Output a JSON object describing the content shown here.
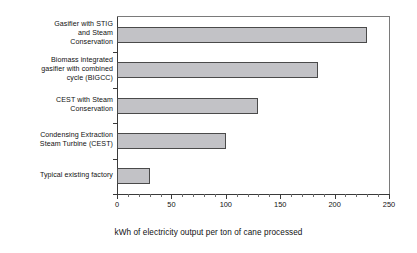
{
  "chart_data": {
    "type": "bar",
    "orientation": "horizontal",
    "title": "",
    "xlabel": "kWh of electricity output per ton of cane processed",
    "ylabel": "",
    "categories": [
      "Typical existing factory",
      "Condensing Extraction Steam Turbine (CEST)",
      "CEST with Steam Conservation",
      "Biomass integrated gasifier with combined cycle (BIGCC)",
      "CEST with Steam Conservation"
    ],
    "categories_display": [
      "Gasifier with STIG and Steam Conservation",
      "Biomass integrated gasifier with combined cycle (BIGCC)",
      "CEST with Steam Conservation",
      "Condensing Extraction Steam Turbine (CEST)",
      "Typical existing factory"
    ],
    "category_lines": [
      [
        "Gasifier with STIG",
        "and Steam",
        "Conservation"
      ],
      [
        "Biomass integrated",
        "gasifier with combined",
        "cycle (BIGCC)"
      ],
      [
        "CEST with Steam",
        "Conservation"
      ],
      [
        "Condensing Extraction",
        "Steam Turbine (CEST)"
      ],
      [
        "Typical existing factory"
      ]
    ],
    "values": [
      230,
      185,
      130,
      100,
      30
    ],
    "xlim": [
      0,
      250
    ],
    "xticks": [
      0,
      50,
      100,
      150,
      200,
      250
    ],
    "xtick_labels": [
      "0",
      "50",
      "100",
      "150",
      "200",
      "250"
    ],
    "xminor_tick_step": 10,
    "grid": false,
    "legend": false,
    "bar_fill_color": "#c2c2c6",
    "bar_border_color": "#4a4a4a",
    "axis_color": "#3a3a3a",
    "background_color": "#ffffff"
  }
}
